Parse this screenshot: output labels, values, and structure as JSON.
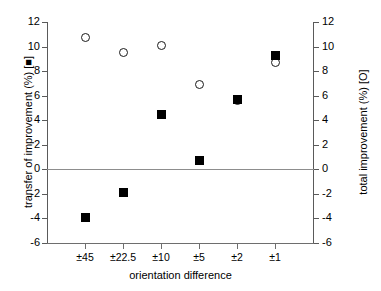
{
  "chart_data": {
    "type": "scatter",
    "title": "",
    "xlabel": "orientation difference",
    "ylabel_left": "transfer of improvement (%) [■]",
    "ylabel_right": "total improvement (%) [O]",
    "categories": [
      "±45",
      "±22.5",
      "±10",
      "±5",
      "±2",
      "±1"
    ],
    "ylim": [
      -6,
      12
    ],
    "yticks": [
      -6,
      -4,
      -2,
      0,
      2,
      4,
      6,
      8,
      10,
      12
    ],
    "ytick_labels": [
      "-6",
      "-4",
      "-2",
      "0",
      "2",
      "4",
      "6",
      "8",
      "10",
      "12"
    ],
    "grid": false,
    "legend": "inline-in-axis-titles",
    "zero_line": 0,
    "series": [
      {
        "name": "total improvement (%) [O]",
        "marker": "open-circle",
        "axis": "right",
        "values": [
          10.7,
          9.5,
          10.1,
          6.9,
          5.6,
          8.7
        ]
      },
      {
        "name": "transfer of improvement (%) [■]",
        "marker": "filled-square",
        "axis": "left",
        "values": [
          -3.9,
          -1.9,
          4.5,
          0.7,
          5.7,
          9.3
        ]
      }
    ]
  },
  "colors": {
    "marker": "#000000",
    "axis": "#5a5a5a",
    "zero_line": "#8d8d8d",
    "background": "#ffffff"
  }
}
